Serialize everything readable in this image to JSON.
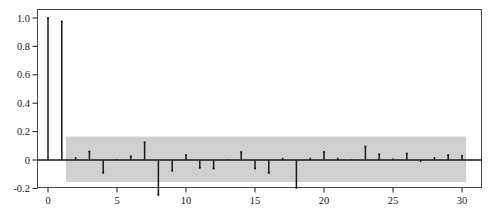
{
  "figure": {
    "name": "autocorrelation-function-plot",
    "background_color": "#ffffff",
    "frame_color": "#3a3a3a",
    "axis_color": "#1a1a1a",
    "stem_color": "#1a1a1a",
    "band_color": "#d0d0d0"
  },
  "chart_data": {
    "type": "bar",
    "title": "",
    "subtitle": "",
    "xlabel": "",
    "ylabel": "",
    "grid": false,
    "legend": null,
    "xlim": [
      -1.2,
      31.5
    ],
    "ylim": [
      -0.3,
      1.08
    ],
    "xticks": [
      0,
      5,
      10,
      15,
      20,
      25,
      30
    ],
    "xtick_labels": [
      "0",
      "5",
      "10",
      "15",
      "20",
      "25",
      "30"
    ],
    "yticks": [
      -0.2,
      0,
      0.2,
      0.4,
      0.6,
      0.8,
      1.0
    ],
    "ytick_labels": [
      "-0.2",
      "0",
      "0.2",
      "0.4",
      "0.6",
      "0.8",
      "1.0"
    ],
    "confidence_band": {
      "label": "significance-band",
      "upper": 0.165,
      "lower": -0.155,
      "x_start": 1.3,
      "x_end": 30.3
    },
    "categories": [
      0,
      1,
      2,
      3,
      4,
      5,
      6,
      7,
      8,
      9,
      10,
      11,
      12,
      13,
      14,
      15,
      16,
      17,
      18,
      19,
      20,
      21,
      22,
      23,
      24,
      25,
      26,
      27,
      28,
      29,
      30
    ],
    "values": [
      1.0,
      0.975,
      0.02,
      0.06,
      -0.09,
      0.005,
      0.025,
      0.125,
      -0.245,
      -0.075,
      0.035,
      -0.055,
      -0.06,
      0.005,
      0.055,
      -0.06,
      -0.09,
      0.015,
      -0.195,
      0.015,
      0.055,
      0.015,
      0.005,
      0.095,
      0.04,
      0.01,
      0.045,
      -0.015,
      0.02,
      0.035,
      0.03
    ]
  }
}
